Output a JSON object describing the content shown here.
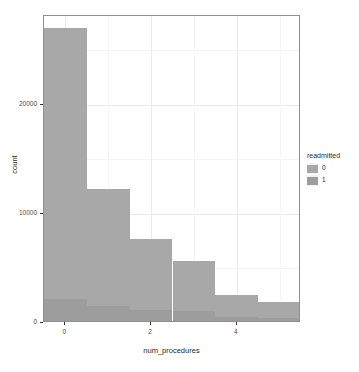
{
  "chart_data": {
    "type": "bar",
    "title": "",
    "subtitle": "",
    "xlabel": "num_procedures",
    "ylabel": "count",
    "stacked": true,
    "orientation": "vertical",
    "grid": true,
    "xlim": [
      -0.5,
      5.5
    ],
    "ylim": [
      0,
      28150
    ],
    "x_ticks": [
      "0",
      "2",
      "4"
    ],
    "x_tick_values": [
      0,
      2,
      4
    ],
    "y_ticks": [
      "0",
      "10000",
      "20000"
    ],
    "y_tick_values": [
      0,
      10000,
      20000
    ],
    "categories": [
      "0",
      "1",
      "2",
      "3",
      "4",
      "5"
    ],
    "series": [
      {
        "name": "0",
        "color": "#a8a8a8",
        "values": [
          24900,
          10750,
          6500,
          4600,
          2000,
          1450
        ]
      },
      {
        "name": "1",
        "color": "#9d9d9d",
        "values": [
          2000,
          1350,
          1000,
          900,
          400,
          300
        ]
      }
    ],
    "totals": [
      26900,
      12100,
      7500,
      5500,
      2400,
      1750
    ],
    "legend": {
      "title": "readmitted",
      "position": "right",
      "entries": [
        {
          "label": "0",
          "color": "#a8a8a8"
        },
        {
          "label": "1",
          "color": "#9d9d9d"
        }
      ]
    }
  },
  "axes": {
    "x_title": "num_procedures",
    "y_title": "count"
  },
  "legend": {
    "title": "readmitted",
    "items": [
      {
        "label": "0"
      },
      {
        "label": "1"
      }
    ]
  },
  "colors": {
    "fill_0": "#a8a8a8",
    "fill_1": "#9d9d9d",
    "panel_border": "#8f8f8f",
    "grid_major": "#ebebeb",
    "text": "#2b2b2b"
  }
}
